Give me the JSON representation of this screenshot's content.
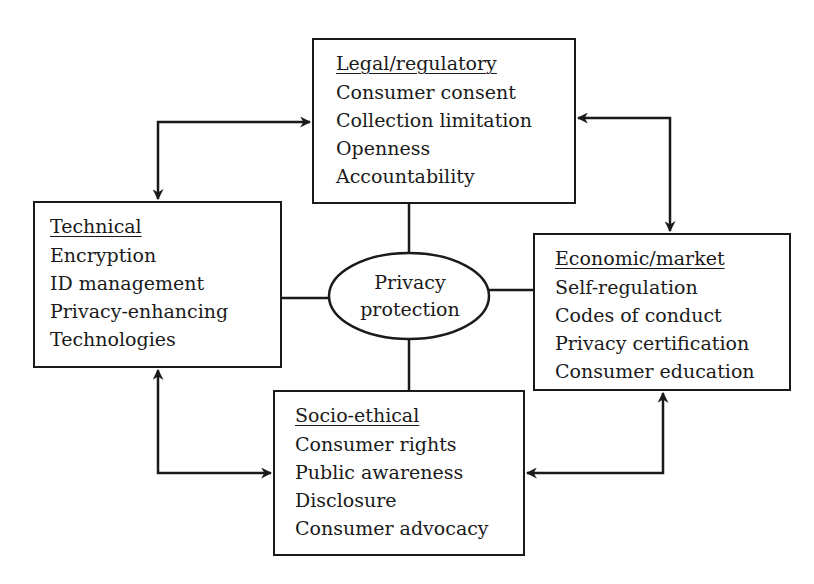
{
  "diagram": {
    "center": {
      "line1": "Privacy",
      "line2": "protection"
    },
    "boxes": {
      "legal": {
        "title": "Legal/regulatory",
        "items": [
          "Consumer consent",
          "Collection limitation",
          "Openness",
          "Accountability"
        ]
      },
      "technical": {
        "title": "Technical",
        "items": [
          "Encryption",
          "ID management",
          "Privacy-enhancing",
          "Technologies"
        ]
      },
      "economic": {
        "title": "Economic/market",
        "items": [
          "Self-regulation",
          "Codes of conduct",
          "Privacy certification",
          "Consumer education"
        ]
      },
      "socio": {
        "title": "Socio-ethical",
        "items": [
          "Consumer rights",
          "Public awareness",
          "Disclosure",
          "Consumer advocacy"
        ]
      }
    },
    "connections": [
      {
        "from": "technical",
        "to": "legal",
        "type": "bidirectional-arrow"
      },
      {
        "from": "legal",
        "to": "economic",
        "type": "bidirectional-arrow"
      },
      {
        "from": "technical",
        "to": "socio",
        "type": "bidirectional-arrow"
      },
      {
        "from": "socio",
        "to": "economic",
        "type": "bidirectional-arrow"
      },
      {
        "from": "center",
        "to": "legal",
        "type": "line"
      },
      {
        "from": "center",
        "to": "technical",
        "type": "line"
      },
      {
        "from": "center",
        "to": "economic",
        "type": "line"
      },
      {
        "from": "center",
        "to": "socio",
        "type": "line"
      }
    ],
    "colors": {
      "stroke": "#1a1a1a",
      "background": "#ffffff"
    }
  }
}
